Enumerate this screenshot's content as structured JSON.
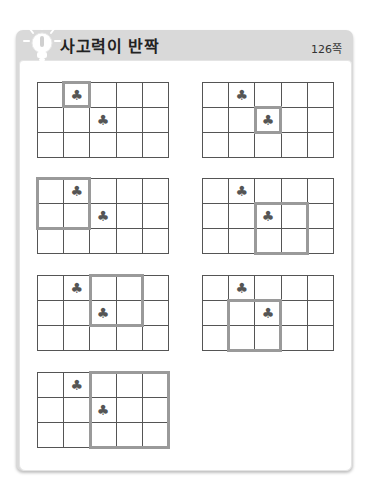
{
  "header": {
    "title": "사고력이 반짝",
    "page": "126쪽",
    "icon": "lightbulb-icon"
  },
  "colors": {
    "header_bg": "#d9d9d9",
    "grid_line": "#555555",
    "highlight": "#9a9a9a",
    "club": "#555555"
  },
  "grid_spec": {
    "rows": 3,
    "cols": 5,
    "symbol": "♣",
    "symbol_cells": [
      [
        0,
        1
      ],
      [
        1,
        2
      ]
    ]
  },
  "puzzles": [
    {
      "x": 37,
      "y": 82,
      "highlight": {
        "row": 0,
        "col": 1,
        "rows": 1,
        "cols": 1
      }
    },
    {
      "x": 202,
      "y": 82,
      "highlight": {
        "row": 1,
        "col": 2,
        "rows": 1,
        "cols": 1
      }
    },
    {
      "x": 37,
      "y": 178,
      "highlight": {
        "row": 0,
        "col": 0,
        "rows": 2,
        "cols": 2
      }
    },
    {
      "x": 202,
      "y": 178,
      "highlight": {
        "row": 1,
        "col": 2,
        "rows": 2,
        "cols": 2
      }
    },
    {
      "x": 37,
      "y": 275,
      "highlight": {
        "row": 0,
        "col": 2,
        "rows": 2,
        "cols": 2
      }
    },
    {
      "x": 202,
      "y": 275,
      "highlight": {
        "row": 1,
        "col": 1,
        "rows": 2,
        "cols": 2
      }
    },
    {
      "x": 37,
      "y": 372,
      "highlight": {
        "row": 0,
        "col": 2,
        "rows": 3,
        "cols": 3
      }
    }
  ]
}
